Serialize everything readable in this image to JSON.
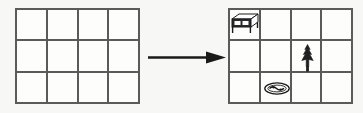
{
  "scene": {
    "title": "Grid transformation: empty room grid becomes furnished room grid",
    "width": 363,
    "height": 113,
    "background_color": "#f7f7f5",
    "line_color": "#5a5a5a",
    "ink_color": "#1a1a1a"
  },
  "arrow": {
    "name": "right-arrow",
    "direction": "right",
    "label": "",
    "color": "#1a1a1a"
  },
  "grids": [
    {
      "id": "before",
      "name": "grid-before",
      "label": "",
      "columns": 4,
      "rows": 3,
      "objects": []
    },
    {
      "id": "after",
      "name": "grid-after",
      "label": "",
      "columns": 4,
      "rows": 3,
      "objects": [
        {
          "icon": "table-icon",
          "label": "table",
          "row": 1,
          "col": 1
        },
        {
          "icon": "pine-tree-icon",
          "label": "tree",
          "row": 2,
          "col": 3
        },
        {
          "icon": "oval-rug-icon",
          "label": "rug",
          "row": 3,
          "col": 2
        }
      ]
    }
  ]
}
